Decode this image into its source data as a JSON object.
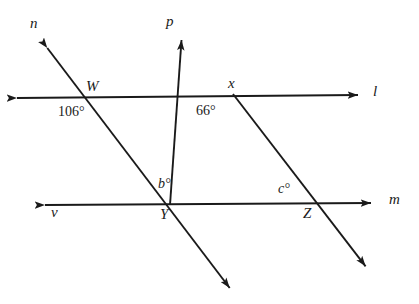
{
  "figure": {
    "type": "geometry-diagram",
    "background_color": "#ffffff",
    "stroke_color": "#1a1a1a",
    "width": 419,
    "height": 304
  },
  "line_labels": {
    "n": "n",
    "p": "p",
    "l": "l",
    "m": "m",
    "v": "v"
  },
  "point_labels": {
    "W": "W",
    "x": "x",
    "Y": "Y",
    "Z": "Z"
  },
  "angle_labels": {
    "at_W": "106°",
    "at_x": "66°",
    "at_Y": "b°",
    "at_Y_var": "b",
    "at_Y_deg": "°",
    "at_Z": "c°",
    "at_Z_var": "c",
    "at_Z_deg": "°"
  },
  "geometry": {
    "points": {
      "W": {
        "x": 97,
        "y": 96
      },
      "X": {
        "x": 233,
        "y": 94
      },
      "Y": {
        "x": 170,
        "y": 205
      },
      "Z": {
        "x": 312,
        "y": 204
      }
    },
    "lines": [
      {
        "name": "l",
        "description": "horizontal line l through W and x, arrowheads both ends",
        "from": {
          "x": 10,
          "y": 98
        },
        "to": {
          "x": 365,
          "y": 95
        },
        "arrow_start": true,
        "arrow_end": true
      },
      {
        "name": "m",
        "description": "horizontal line m through Y and Z, arrowheads both ends",
        "from": {
          "x": 38,
          "y": 205
        },
        "to": {
          "x": 378,
          "y": 203
        },
        "arrow_start": true,
        "arrow_end": true
      },
      {
        "name": "n",
        "description": "transversal n from upper-left through W and Y to lower-right",
        "from": {
          "x": 42,
          "y": 41
        },
        "to": {
          "x": 235,
          "y": 295
        },
        "arrow_start": true,
        "arrow_end": true
      },
      {
        "name": "p",
        "description": "ray p from Y up-right through x to upper-left arrowhead",
        "from": {
          "x": 170,
          "y": 205
        },
        "to": {
          "x": 182,
          "y": 33
        },
        "arrow_start": false,
        "arrow_end": true
      },
      {
        "name": "xz",
        "description": "transversal from x down-right through Z to lower-right arrowhead",
        "from": {
          "x": 233,
          "y": 94
        },
        "to": {
          "x": 370,
          "y": 272
        },
        "arrow_start": false,
        "arrow_end": true
      }
    ]
  }
}
